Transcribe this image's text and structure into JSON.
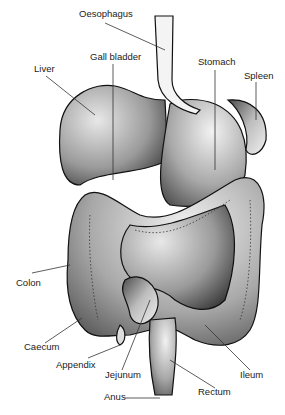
{
  "diagram": {
    "labels": [
      {
        "id": "oesophagus",
        "text": "Oesophagus",
        "x": 79,
        "y": 14
      },
      {
        "id": "gall-bladder",
        "text": "Gall bladder",
        "x": 90,
        "y": 56
      },
      {
        "id": "liver",
        "text": "Liver",
        "x": 34,
        "y": 68
      },
      {
        "id": "stomach",
        "text": "Stomach",
        "x": 198,
        "y": 60
      },
      {
        "id": "spleen",
        "text": "Spleen",
        "x": 244,
        "y": 74
      },
      {
        "id": "colon",
        "text": "Colon",
        "x": 16,
        "y": 281
      },
      {
        "id": "caecum",
        "text": "Caecum",
        "x": 24,
        "y": 345
      },
      {
        "id": "appendix",
        "text": "Appendix",
        "x": 56,
        "y": 363
      },
      {
        "id": "jejunum",
        "text": "Jejunum",
        "x": 105,
        "y": 373
      },
      {
        "id": "ileum",
        "text": "Ileum",
        "x": 240,
        "y": 373
      },
      {
        "id": "rectum",
        "text": "Rectum",
        "x": 198,
        "y": 390
      },
      {
        "id": "anus",
        "text": "Anus",
        "x": 104,
        "y": 395
      }
    ]
  }
}
